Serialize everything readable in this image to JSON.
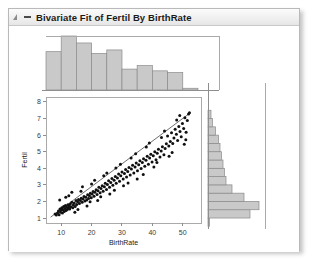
{
  "window": {
    "title": "Bivariate Fit of Fertil By BirthRate",
    "disclosure_icon": "triangle-right-icon",
    "collapse_icon": "minus-icon"
  },
  "chart_data": {
    "type": "scatter",
    "title": "Bivariate Fit of Fertil By BirthRate",
    "xlabel": "BirthRate",
    "ylabel": "Fertil",
    "xlim": [
      5,
      56
    ],
    "ylim": [
      0.7,
      8.3
    ],
    "xticks": [
      10,
      20,
      30,
      40,
      50
    ],
    "yticks": [
      1,
      2,
      3,
      4,
      5,
      6,
      7,
      8
    ],
    "grid": false,
    "legend": "none",
    "fit_line": {
      "type": "linear-regression",
      "x_start": 6.5,
      "y_start": 1.05,
      "x_end": 52.5,
      "y_end": 7.35
    },
    "points": [
      [
        8.0,
        1.25
      ],
      [
        8.4,
        1.18
      ],
      [
        8.8,
        1.3
      ],
      [
        9.1,
        1.42
      ],
      [
        9.3,
        1.2
      ],
      [
        9.6,
        1.55
      ],
      [
        9.8,
        1.35
      ],
      [
        10.0,
        1.48
      ],
      [
        10.2,
        1.62
      ],
      [
        10.4,
        1.3
      ],
      [
        10.6,
        1.5
      ],
      [
        10.8,
        1.7
      ],
      [
        11.0,
        1.4
      ],
      [
        11.2,
        1.58
      ],
      [
        11.4,
        1.75
      ],
      [
        11.6,
        1.45
      ],
      [
        11.8,
        1.65
      ],
      [
        12.0,
        1.52
      ],
      [
        12.2,
        1.8
      ],
      [
        12.4,
        1.6
      ],
      [
        12.6,
        1.72
      ],
      [
        12.8,
        1.55
      ],
      [
        13.0,
        1.85
      ],
      [
        13.2,
        1.68
      ],
      [
        13.5,
        1.95
      ],
      [
        13.8,
        1.62
      ],
      [
        14.0,
        1.78
      ],
      [
        14.3,
        1.9
      ],
      [
        14.6,
        1.7
      ],
      [
        14.9,
        2.05
      ],
      [
        15.1,
        1.82
      ],
      [
        15.4,
        1.98
      ],
      [
        15.7,
        2.12
      ],
      [
        16.0,
        1.88
      ],
      [
        16.3,
        2.05
      ],
      [
        16.6,
        2.2
      ],
      [
        16.9,
        1.95
      ],
      [
        17.2,
        2.15
      ],
      [
        17.5,
        2.3
      ],
      [
        17.8,
        2.02
      ],
      [
        18.1,
        2.25
      ],
      [
        18.4,
        2.08
      ],
      [
        18.7,
        2.4
      ],
      [
        19.0,
        2.18
      ],
      [
        19.3,
        2.35
      ],
      [
        19.6,
        2.5
      ],
      [
        19.9,
        2.22
      ],
      [
        20.2,
        2.45
      ],
      [
        20.5,
        2.6
      ],
      [
        20.8,
        2.32
      ],
      [
        21.1,
        2.55
      ],
      [
        21.5,
        2.7
      ],
      [
        21.8,
        2.42
      ],
      [
        22.1,
        2.65
      ],
      [
        22.4,
        2.85
      ],
      [
        22.8,
        2.52
      ],
      [
        23.1,
        2.78
      ],
      [
        23.5,
        2.95
      ],
      [
        23.8,
        2.62
      ],
      [
        24.2,
        2.88
      ],
      [
        24.5,
        3.1
      ],
      [
        24.9,
        2.72
      ],
      [
        25.2,
        3.02
      ],
      [
        25.6,
        3.25
      ],
      [
        25.9,
        2.85
      ],
      [
        26.3,
        3.15
      ],
      [
        26.7,
        3.38
      ],
      [
        27.0,
        2.98
      ],
      [
        27.4,
        3.28
      ],
      [
        27.8,
        3.5
      ],
      [
        28.1,
        3.1
      ],
      [
        28.5,
        3.42
      ],
      [
        28.9,
        3.65
      ],
      [
        29.2,
        3.22
      ],
      [
        29.6,
        3.55
      ],
      [
        30.0,
        3.78
      ],
      [
        30.4,
        3.35
      ],
      [
        30.8,
        3.68
      ],
      [
        31.2,
        3.92
      ],
      [
        31.5,
        3.48
      ],
      [
        31.9,
        3.8
      ],
      [
        32.3,
        4.05
      ],
      [
        32.7,
        3.6
      ],
      [
        33.1,
        3.95
      ],
      [
        33.5,
        4.18
      ],
      [
        33.9,
        3.72
      ],
      [
        34.3,
        4.08
      ],
      [
        34.7,
        4.32
      ],
      [
        35.1,
        3.85
      ],
      [
        35.5,
        4.22
      ],
      [
        35.9,
        4.45
      ],
      [
        36.3,
        3.98
      ],
      [
        36.7,
        4.35
      ],
      [
        37.1,
        4.58
      ],
      [
        37.5,
        4.12
      ],
      [
        37.9,
        4.48
      ],
      [
        38.3,
        4.72
      ],
      [
        38.7,
        4.25
      ],
      [
        39.1,
        4.62
      ],
      [
        39.5,
        4.85
      ],
      [
        39.9,
        4.38
      ],
      [
        40.3,
        4.75
      ],
      [
        40.8,
        5.0
      ],
      [
        41.2,
        4.52
      ],
      [
        41.6,
        4.9
      ],
      [
        42.0,
        5.15
      ],
      [
        42.5,
        4.68
      ],
      [
        42.9,
        5.05
      ],
      [
        43.3,
        5.3
      ],
      [
        43.8,
        4.82
      ],
      [
        44.2,
        5.2
      ],
      [
        44.6,
        5.48
      ],
      [
        45.0,
        5.95
      ],
      [
        45.4,
        5.35
      ],
      [
        45.9,
        5.62
      ],
      [
        46.3,
        6.15
      ],
      [
        46.7,
        5.5
      ],
      [
        47.1,
        5.82
      ],
      [
        47.5,
        6.35
      ],
      [
        47.9,
        6.05
      ],
      [
        48.3,
        5.68
      ],
      [
        48.7,
        6.52
      ],
      [
        49.1,
        6.22
      ],
      [
        49.5,
        5.9
      ],
      [
        49.9,
        6.7
      ],
      [
        50.3,
        6.4
      ],
      [
        50.7,
        7.05
      ],
      [
        51.1,
        6.18
      ],
      [
        51.5,
        6.88
      ],
      [
        51.9,
        7.28
      ],
      [
        12.5,
        2.35
      ],
      [
        14.5,
        1.35
      ],
      [
        16.5,
        2.62
      ],
      [
        18.5,
        1.72
      ],
      [
        20.0,
        3.05
      ],
      [
        22.0,
        2.05
      ],
      [
        24.0,
        3.55
      ],
      [
        26.0,
        2.45
      ],
      [
        28.0,
        4.02
      ],
      [
        30.5,
        2.95
      ],
      [
        33.0,
        4.62
      ],
      [
        35.0,
        3.35
      ],
      [
        38.0,
        5.28
      ],
      [
        40.5,
        4.08
      ],
      [
        43.0,
        5.85
      ],
      [
        45.5,
        4.72
      ],
      [
        48.0,
        6.92
      ],
      [
        50.5,
        5.45
      ],
      [
        52.2,
        7.35
      ],
      [
        9.5,
        2.08
      ],
      [
        11.5,
        2.25
      ],
      [
        13.5,
        2.55
      ],
      [
        15.5,
        1.52
      ],
      [
        17.0,
        2.88
      ],
      [
        19.5,
        1.98
      ],
      [
        21.0,
        3.28
      ],
      [
        23.0,
        2.28
      ],
      [
        25.0,
        3.72
      ],
      [
        27.5,
        2.68
      ],
      [
        29.5,
        4.25
      ],
      [
        32.0,
        3.12
      ],
      [
        34.5,
        4.88
      ],
      [
        37.0,
        3.62
      ],
      [
        39.0,
        5.52
      ],
      [
        41.5,
        4.35
      ],
      [
        44.0,
        6.25
      ],
      [
        46.5,
        4.95
      ],
      [
        49.0,
        7.18
      ],
      [
        51.0,
        5.72
      ]
    ],
    "x_histogram": {
      "orientation": "vertical",
      "bin_edges": [
        5,
        10,
        15,
        20,
        25,
        30,
        35,
        40,
        45,
        50,
        55
      ],
      "counts": [
        22,
        31,
        27,
        21,
        23,
        12,
        14,
        11,
        10,
        1
      ]
    },
    "y_histogram": {
      "orientation": "horizontal",
      "bin_edges": [
        0.5,
        1.0,
        1.5,
        2.0,
        2.5,
        3.0,
        3.5,
        4.0,
        4.5,
        5.0,
        5.5,
        6.0,
        6.5,
        7.0,
        7.5
      ],
      "counts": [
        1,
        28,
        34,
        24,
        16,
        12,
        11,
        10,
        9,
        8,
        7,
        5,
        3,
        2
      ]
    }
  }
}
